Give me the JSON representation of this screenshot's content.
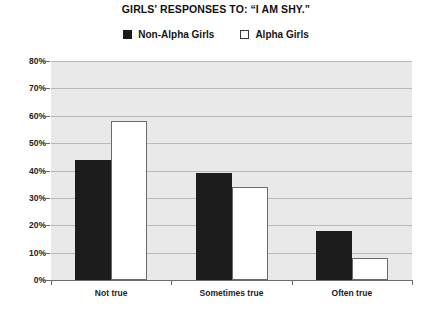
{
  "chart_data": {
    "type": "bar",
    "title": "GIRLS' RESPONSES TO: “I AM SHY.”",
    "xlabel": "",
    "ylabel": "",
    "categories": [
      "Not true",
      "Sometimes true",
      "Often true"
    ],
    "series": [
      {
        "name": "Non-Alpha Girls",
        "values": [
          44,
          39,
          18
        ],
        "color": "#1c1c1c"
      },
      {
        "name": "Alpha Girls",
        "values": [
          58,
          34,
          8
        ],
        "color": "#ffffff"
      }
    ],
    "ylim": [
      0,
      80
    ],
    "ytick_labels": [
      "0%",
      "10%",
      "20%",
      "30%",
      "40%",
      "50%",
      "60%",
      "70%",
      "80%"
    ],
    "ytick_values": [
      0,
      10,
      20,
      30,
      40,
      50,
      60,
      70,
      80
    ],
    "grid": true,
    "legend_position": "top-center",
    "plot_background": "#e9e9e9"
  },
  "legend": {
    "items": [
      {
        "label": "Non-Alpha Girls",
        "swatch": "dark"
      },
      {
        "label": "Alpha Girls",
        "swatch": "light"
      }
    ]
  }
}
